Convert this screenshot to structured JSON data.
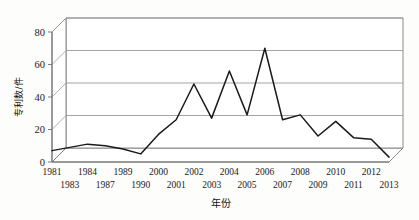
{
  "chart_data": {
    "type": "line",
    "title": "",
    "xlabel": "年份",
    "ylabel": "专利数/件",
    "ylim": [
      0,
      80
    ],
    "yticks": [
      0,
      20,
      40,
      60,
      80
    ],
    "grid": true,
    "legend": "none",
    "style": "3d-perspective",
    "categories": [
      "1981",
      "1983",
      "1984",
      "1987",
      "1989",
      "1990",
      "2000",
      "2001",
      "2002",
      "2003",
      "2004",
      "2005",
      "2006",
      "2007",
      "2008",
      "2009",
      "2010",
      "2011",
      "2012",
      "2013"
    ],
    "x_label_rows": {
      "top": [
        "1981",
        "1984",
        "1989",
        "2000",
        "2002",
        "2004",
        "2006",
        "2008",
        "2010",
        "2012"
      ],
      "bottom": [
        "1983",
        "1987",
        "1990",
        "2001",
        "2003",
        "2005",
        "2007",
        "2009",
        "2011",
        "2013"
      ]
    },
    "series": [
      {
        "name": "专利数",
        "values": [
          7,
          9,
          11,
          10,
          8,
          5,
          17,
          26,
          48,
          27,
          56,
          29,
          70,
          26,
          29,
          16,
          25,
          15,
          14,
          3
        ]
      }
    ]
  },
  "colors": {
    "background": "#fdfdfb",
    "line": "#1a1a1a",
    "grid": "#9a9a9a",
    "axis": "#6e6e6e",
    "text": "#111111"
  }
}
